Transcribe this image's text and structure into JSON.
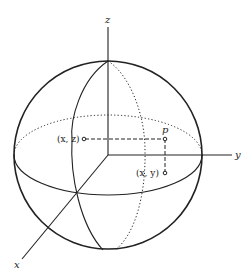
{
  "diagram": {
    "axes": {
      "x": {
        "label": "x"
      },
      "y": {
        "label": "y"
      },
      "z": {
        "label": "z"
      }
    },
    "points": {
      "p": {
        "label": "p"
      },
      "xz": {
        "label": "(x, z)"
      },
      "xy": {
        "label": "(x, y)"
      }
    },
    "colors": {
      "stroke": "#222222",
      "background": "#ffffff"
    }
  }
}
